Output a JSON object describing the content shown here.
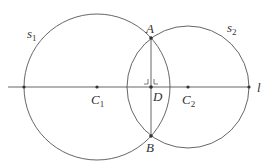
{
  "colors": {
    "stroke": "#555555",
    "point": "#333333",
    "text": "#333333"
  },
  "line": {
    "label": "l",
    "x1": 8,
    "y": 87,
    "x2": 250
  },
  "circles": [
    {
      "name": "s",
      "sub": "1",
      "cx": 97,
      "cy": 87,
      "r": 73
    },
    {
      "name": "s",
      "sub": "2",
      "cx": 188,
      "cy": 87,
      "r": 61
    }
  ],
  "points": {
    "A": {
      "label": "A",
      "x": 151,
      "y": 38
    },
    "B": {
      "label": "B",
      "x": 151,
      "y": 136
    },
    "C1": {
      "label": "C",
      "sub": "1",
      "x": 97,
      "y": 87
    },
    "C2": {
      "label": "C",
      "sub": "2",
      "x": 188,
      "y": 87
    },
    "D": {
      "label": "D",
      "x": 151,
      "y": 87
    },
    "L1": {
      "x": 24,
      "y": 87
    },
    "R2": {
      "x": 249,
      "y": 87
    }
  },
  "labels": {
    "s1": {
      "main": "s",
      "sub": "1"
    },
    "s2": {
      "main": "s",
      "sub": "2"
    },
    "A": "A",
    "B": "B",
    "C1": {
      "main": "C",
      "sub": "1"
    },
    "C2": {
      "main": "C",
      "sub": "2"
    },
    "D": "D",
    "l": "l"
  }
}
